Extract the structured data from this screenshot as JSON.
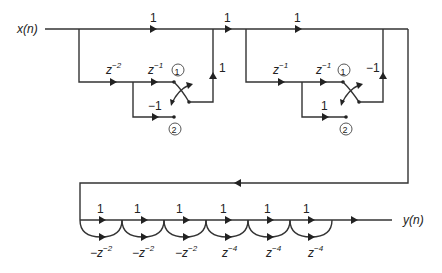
{
  "diagram": {
    "type": "signal-flow-graph",
    "input_label": "x(n)",
    "output_label": "y(n)",
    "stage1": {
      "top_gain": "1",
      "delay1": {
        "base": "z",
        "exp": "−2"
      },
      "delay2": {
        "base": "z",
        "exp": "−1"
      },
      "lower_gain": "−1",
      "feedback_gain": "1",
      "node1": "1",
      "node2": "2"
    },
    "between_gain": "1",
    "stage2": {
      "top_gain": "1",
      "delay1": {
        "base": "z",
        "exp": "−1"
      },
      "delay2": {
        "base": "z",
        "exp": "−1"
      },
      "lower_gain": "1",
      "feedback_gain": "−1",
      "node1": "1",
      "node2": "2"
    },
    "output_chain": {
      "sections": [
        {
          "top_gain": "1",
          "bottom": {
            "sign": "−",
            "base": "z",
            "exp": "−2"
          }
        },
        {
          "top_gain": "1",
          "bottom": {
            "sign": "−",
            "base": "z",
            "exp": "−2"
          }
        },
        {
          "top_gain": "1",
          "bottom": {
            "sign": "−",
            "base": "z",
            "exp": "−2"
          }
        },
        {
          "top_gain": "1",
          "bottom": {
            "sign": "",
            "base": "z",
            "exp": "−4"
          }
        },
        {
          "top_gain": "1",
          "bottom": {
            "sign": "",
            "base": "z",
            "exp": "−4"
          }
        },
        {
          "top_gain": "1",
          "bottom": {
            "sign": "",
            "base": "z",
            "exp": "−4"
          }
        }
      ]
    }
  }
}
